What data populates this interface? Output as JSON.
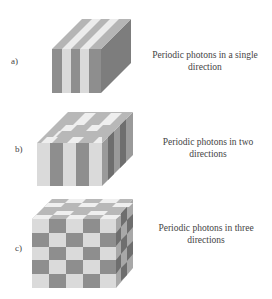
{
  "figure": {
    "panels": [
      {
        "label": "a)",
        "caption": "Periodic photons in a single",
        "caption2": "direction",
        "pattern": "1D stripes"
      },
      {
        "label": "b)",
        "caption": "Periodic photons in two",
        "caption2": "directions",
        "pattern": "2D stripes + top checker"
      },
      {
        "label": "c)",
        "caption": "Periodic photons in three",
        "caption2": "directions",
        "pattern": "3D checkerboard"
      }
    ],
    "colors": {
      "light": "#d9d9d9",
      "dark": "#8c8c8c",
      "side": "#7a7a7a",
      "top_light": "#ececec",
      "top_dark": "#b3b3b3"
    }
  }
}
